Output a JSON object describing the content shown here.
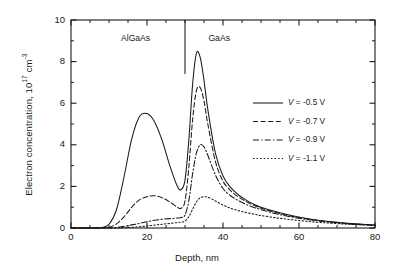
{
  "figure": {
    "background": "#ffffff",
    "frame_color": "#1a1a1a",
    "curve_color": "#1a1a1a"
  },
  "axes": {
    "x": {
      "label_prefix": "Depth, ",
      "label_unit": "nm",
      "label": "Depth, nm",
      "ticks": [
        0,
        20,
        40,
        60,
        80
      ],
      "tick_labels": [
        "0",
        "20",
        "40",
        "60",
        "80"
      ],
      "min": 0,
      "max": 80,
      "minor_step": 5
    },
    "y": {
      "label_prefix": "Electron concentration, 10",
      "label_exp1": "17",
      "label_mid": " cm",
      "label_exp2": "-3",
      "label": "Electron concentration, 10^17 cm^-3",
      "ticks": [
        0,
        2,
        4,
        6,
        8,
        10
      ],
      "tick_labels": [
        "0",
        "2",
        "4",
        "6",
        "8",
        "10"
      ],
      "min": 0,
      "max": 10,
      "minor_step": 1
    }
  },
  "annotations": {
    "region_left": "AlGaAs",
    "region_right": "GaAs",
    "interface_depth_nm": 30
  },
  "legend": {
    "position": "center-right",
    "entries": [
      {
        "label": "V = -0.5 V",
        "var": "V",
        "rest": " = -0.5 V",
        "style": "solid"
      },
      {
        "label": "V = -0.7 V",
        "var": "V",
        "rest": " = -0.7 V",
        "style": "dashed"
      },
      {
        "label": "V = -0.9 V",
        "var": "V",
        "rest": " = -0.9 V",
        "style": "dash-dot"
      },
      {
        "label": "V = -1.1 V",
        "var": "V",
        "rest": " = -1.1 V",
        "style": "dotted"
      }
    ]
  },
  "chart_data": {
    "type": "line",
    "title": "",
    "xlabel": "Depth, nm",
    "ylabel": "Electron concentration, 10^17 cm^-3",
    "xlim": [
      0,
      80
    ],
    "ylim": [
      0,
      10
    ],
    "grid": false,
    "legend_position": "center-right",
    "annotations": [
      {
        "text": "AlGaAs",
        "x": 17,
        "y": 9.1
      },
      {
        "text": "GaAs",
        "x": 39,
        "y": 9.1
      },
      {
        "type": "vline",
        "x": 30,
        "y_from": 7.4,
        "y_to": 10
      }
    ],
    "x": [
      0,
      2,
      4,
      6,
      8,
      10,
      12,
      14,
      16,
      18,
      20,
      22,
      24,
      26,
      28,
      29,
      30,
      31,
      32,
      33,
      34,
      35,
      36,
      38,
      40,
      42,
      44,
      46,
      48,
      50,
      54,
      58,
      62,
      66,
      70,
      74,
      80
    ],
    "series": [
      {
        "name": "V = -0.5 V",
        "style": "solid",
        "values": [
          0,
          0,
          0,
          0,
          0.02,
          0.18,
          0.9,
          2.5,
          4.3,
          5.35,
          5.5,
          5.1,
          4.2,
          3.0,
          2.0,
          1.85,
          2.3,
          4.2,
          6.9,
          8.4,
          8.2,
          7.1,
          5.7,
          3.6,
          2.5,
          1.95,
          1.6,
          1.35,
          1.15,
          1.0,
          0.78,
          0.6,
          0.46,
          0.35,
          0.27,
          0.21,
          0.14
        ]
      },
      {
        "name": "V = -0.7 V",
        "style": "dashed",
        "values": [
          0,
          0,
          0,
          0,
          0,
          0.03,
          0.2,
          0.55,
          1.0,
          1.35,
          1.5,
          1.55,
          1.45,
          1.25,
          1.0,
          0.95,
          1.3,
          2.9,
          5.2,
          6.6,
          6.75,
          6.1,
          5.0,
          3.2,
          2.25,
          1.8,
          1.5,
          1.28,
          1.1,
          0.95,
          0.74,
          0.57,
          0.44,
          0.34,
          0.26,
          0.2,
          0.14
        ]
      },
      {
        "name": "V = -0.9 V",
        "style": "dash-dot",
        "values": [
          0,
          0,
          0,
          0,
          0,
          0,
          0.02,
          0.08,
          0.15,
          0.22,
          0.3,
          0.37,
          0.42,
          0.45,
          0.48,
          0.5,
          0.62,
          1.3,
          2.6,
          3.6,
          4.0,
          3.9,
          3.5,
          2.55,
          1.9,
          1.55,
          1.32,
          1.14,
          1.0,
          0.88,
          0.68,
          0.53,
          0.41,
          0.32,
          0.25,
          0.19,
          0.13
        ]
      },
      {
        "name": "V = -1.1 V",
        "style": "dotted",
        "values": [
          0,
          0,
          0,
          0,
          0,
          0,
          0,
          0.01,
          0.03,
          0.06,
          0.1,
          0.14,
          0.18,
          0.22,
          0.26,
          0.28,
          0.33,
          0.55,
          0.9,
          1.25,
          1.45,
          1.5,
          1.48,
          1.3,
          1.1,
          0.95,
          0.84,
          0.75,
          0.67,
          0.6,
          0.49,
          0.4,
          0.32,
          0.26,
          0.21,
          0.17,
          0.12
        ]
      }
    ]
  }
}
